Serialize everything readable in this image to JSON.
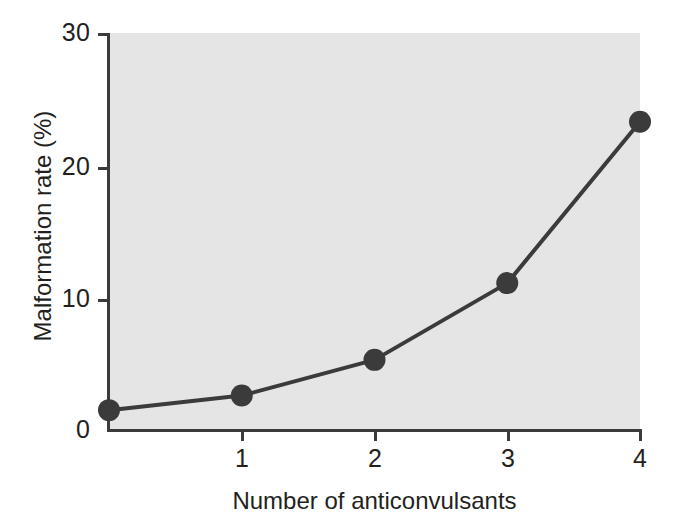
{
  "chart_data": {
    "type": "line",
    "title": "",
    "subtitle": "",
    "xlabel": "Number of anticonvulsants",
    "ylabel": "Malformation rate (%)",
    "x": [
      0,
      1,
      2,
      3,
      4
    ],
    "values": [
      1.5,
      2.6,
      5.3,
      11.1,
      23.3
    ],
    "series": [
      {
        "name": "Malformation rate",
        "values": [
          1.5,
          2.6,
          5.3,
          11.1,
          23.3
        ]
      }
    ],
    "xlim": [
      0,
      4
    ],
    "ylim": [
      0,
      30
    ],
    "x_ticks": [
      1,
      2,
      3,
      4
    ],
    "x_tick_labels": [
      "1",
      "2",
      "3",
      "4"
    ],
    "y_ticks": [
      0,
      10,
      20,
      30
    ],
    "y_tick_labels": [
      "0",
      "10",
      "20",
      "30"
    ],
    "grid": false,
    "legend": false,
    "legend_position": "none",
    "marker": "filled-circle",
    "line_color": "#3b3b3b",
    "marker_color": "#3b3b3b",
    "plot_background": "#e5e5e5",
    "figure_background": "#ffffff",
    "text_color": "#231f20"
  },
  "axes": {
    "y_labels": {
      "t0": "0",
      "t10": "10",
      "t20": "20",
      "t30": "30"
    },
    "x_labels": {
      "t1": "1",
      "t2": "2",
      "t3": "3",
      "t4": "4"
    },
    "x_title": "Number of anticonvulsants",
    "y_title": "Malformation rate (%)"
  }
}
